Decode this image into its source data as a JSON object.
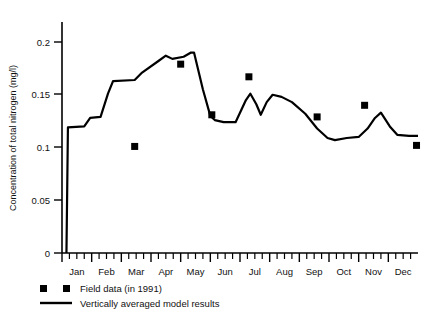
{
  "chart_data": {
    "type": "line",
    "title": "",
    "xlabel": "",
    "ylabel": "Concentration of total nitrogen (mg/l)",
    "ylim": [
      0,
      0.22
    ],
    "yticks": [
      0,
      0.05,
      0.1,
      0.15,
      0.2
    ],
    "ytick_labels": [
      "0",
      "0.05",
      "0.1",
      "0.15",
      "0.2"
    ],
    "xlim": [
      0,
      12
    ],
    "categories": [
      "Jan",
      "Feb",
      "Mar",
      "Apr",
      "May",
      "Jun",
      "Jul",
      "Aug",
      "Sep",
      "Oct",
      "Nov",
      "Dec"
    ],
    "xtick_labels": [
      "Jan",
      "Feb",
      "Mar",
      "Apr",
      "May",
      "Jun",
      "Jul",
      "Aug",
      "Sep",
      "Oct",
      "Nov",
      "Dec"
    ],
    "minor_ticks_per_month": 4,
    "grid": false,
    "legend_position": "below-axes-left",
    "series": [
      {
        "name": "Vertically averaged model results",
        "kind": "line",
        "points": [
          {
            "x": 0.15,
            "y": 0.0
          },
          {
            "x": 0.2,
            "y": 0.119
          },
          {
            "x": 0.75,
            "y": 0.12
          },
          {
            "x": 0.95,
            "y": 0.128
          },
          {
            "x": 1.3,
            "y": 0.129
          },
          {
            "x": 1.55,
            "y": 0.151
          },
          {
            "x": 1.72,
            "y": 0.163
          },
          {
            "x": 2.45,
            "y": 0.164
          },
          {
            "x": 2.7,
            "y": 0.171
          },
          {
            "x": 3.25,
            "y": 0.182
          },
          {
            "x": 3.5,
            "y": 0.187
          },
          {
            "x": 3.72,
            "y": 0.184
          },
          {
            "x": 4.1,
            "y": 0.186
          },
          {
            "x": 4.35,
            "y": 0.19
          },
          {
            "x": 4.45,
            "y": 0.19
          },
          {
            "x": 4.75,
            "y": 0.155
          },
          {
            "x": 5.0,
            "y": 0.13
          },
          {
            "x": 5.15,
            "y": 0.126
          },
          {
            "x": 5.45,
            "y": 0.124
          },
          {
            "x": 5.85,
            "y": 0.124
          },
          {
            "x": 6.0,
            "y": 0.133
          },
          {
            "x": 6.2,
            "y": 0.145
          },
          {
            "x": 6.35,
            "y": 0.151
          },
          {
            "x": 6.55,
            "y": 0.141
          },
          {
            "x": 6.7,
            "y": 0.131
          },
          {
            "x": 6.9,
            "y": 0.143
          },
          {
            "x": 7.1,
            "y": 0.15
          },
          {
            "x": 7.4,
            "y": 0.148
          },
          {
            "x": 7.75,
            "y": 0.143
          },
          {
            "x": 8.2,
            "y": 0.132
          },
          {
            "x": 8.6,
            "y": 0.118
          },
          {
            "x": 8.95,
            "y": 0.109
          },
          {
            "x": 9.2,
            "y": 0.107
          },
          {
            "x": 9.6,
            "y": 0.109
          },
          {
            "x": 10.0,
            "y": 0.11
          },
          {
            "x": 10.3,
            "y": 0.118
          },
          {
            "x": 10.55,
            "y": 0.128
          },
          {
            "x": 10.75,
            "y": 0.133
          },
          {
            "x": 11.05,
            "y": 0.12
          },
          {
            "x": 11.3,
            "y": 0.112
          },
          {
            "x": 11.7,
            "y": 0.111
          },
          {
            "x": 12.0,
            "y": 0.111
          }
        ]
      },
      {
        "name": "Field data (in 1991)",
        "kind": "scatter",
        "points": [
          {
            "x": 2.45,
            "y": 0.101
          },
          {
            "x": 4.0,
            "y": 0.179
          },
          {
            "x": 5.05,
            "y": 0.131
          },
          {
            "x": 6.3,
            "y": 0.167
          },
          {
            "x": 8.6,
            "y": 0.129
          },
          {
            "x": 10.2,
            "y": 0.14
          },
          {
            "x": 11.95,
            "y": 0.102
          }
        ]
      }
    ]
  },
  "legend": {
    "items": [
      {
        "marker": "square",
        "label": "Field data (in 1991)"
      },
      {
        "marker": "line",
        "label": "Vertically averaged model results"
      }
    ]
  }
}
